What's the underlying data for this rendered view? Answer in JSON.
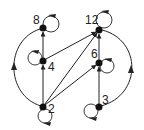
{
  "diagram": {
    "type": "directed-graph",
    "colors": {
      "stroke": "#222222",
      "node": "#111111",
      "background": "#ffffff"
    },
    "nodes": [
      {
        "id": "8",
        "label": "8",
        "x": 43,
        "y": 28
      },
      {
        "id": "12",
        "label": "12",
        "x": 99,
        "y": 30
      },
      {
        "id": "4",
        "label": "4",
        "x": 43,
        "y": 61
      },
      {
        "id": "6",
        "label": "6",
        "x": 99,
        "y": 63
      },
      {
        "id": "2",
        "label": "2",
        "x": 43,
        "y": 107
      },
      {
        "id": "3",
        "label": "3",
        "x": 99,
        "y": 107
      }
    ],
    "edges": [
      {
        "from": "2",
        "to": "4"
      },
      {
        "from": "4",
        "to": "8"
      },
      {
        "from": "2",
        "to": "8",
        "style": "arc-left"
      },
      {
        "from": "3",
        "to": "6"
      },
      {
        "from": "6",
        "to": "12"
      },
      {
        "from": "3",
        "to": "12",
        "style": "arc-right"
      },
      {
        "from": "2",
        "to": "6"
      },
      {
        "from": "2",
        "to": "12"
      },
      {
        "from": "4",
        "to": "12"
      },
      {
        "from": "8",
        "to": "12",
        "style": "dashed"
      }
    ],
    "self_loops": [
      "2",
      "3",
      "4",
      "6",
      "8",
      "12"
    ]
  }
}
